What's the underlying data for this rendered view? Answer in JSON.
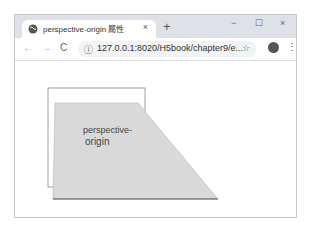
{
  "browser": {
    "tab": {
      "title": "perspective-origin 屬性",
      "close_label": "×"
    },
    "new_tab_label": "+",
    "window_controls": {
      "minimize": "−",
      "maximize": "☐",
      "close": "×"
    },
    "nav": {
      "back": "←",
      "forward": "→",
      "reload": "C"
    },
    "address": {
      "info_icon": "ⓘ",
      "url": "127.0.0.1:8020/H5book/chapter9/e...",
      "bookmark_icon": "☆"
    },
    "menu_icon": "⋮"
  },
  "page": {
    "box_text_line1": "perspective-",
    "box_text_line2": "origin",
    "colors": {
      "fill": "#d9d9d9",
      "outline": "#777777",
      "text": "#444444"
    }
  }
}
